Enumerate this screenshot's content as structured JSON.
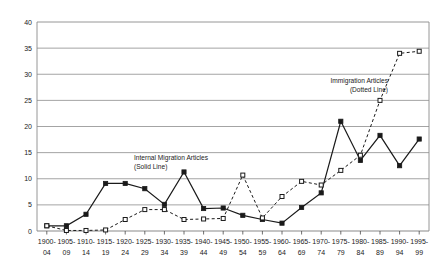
{
  "chart_data": {
    "type": "line",
    "title": "",
    "xlabel": "",
    "ylabel": "",
    "ylim": [
      0,
      40
    ],
    "ytick_step": 5,
    "grid": true,
    "legend_position": "inline-annotation",
    "yticks": [
      "0",
      "5",
      "10",
      "15",
      "20",
      "25",
      "30",
      "35",
      "40"
    ],
    "categories": [
      "1900-\n04",
      "1905-\n09",
      "1910-\n14",
      "1915-\n19",
      "1920-\n24",
      "1925-\n29",
      "1930-\n34",
      "1935-\n39",
      "1940-\n44",
      "1945-\n49",
      "1950-\n54",
      "1955-\n59",
      "1960-\n64",
      "1965-\n69",
      "1970-\n74",
      "1975-\n79",
      "1980-\n84",
      "1985-\n89",
      "1990-\n94",
      "1995-\n99"
    ],
    "categories_line1": [
      "1900-",
      "1905-",
      "1910-",
      "1915-",
      "1920-",
      "1925-",
      "1930-",
      "1935-",
      "1940-",
      "1945-",
      "1950-",
      "1955-",
      "1960-",
      "1965-",
      "1970-",
      "1975-",
      "1980-",
      "1985-",
      "1990-",
      "1995-"
    ],
    "categories_line2": [
      "04",
      "09",
      "14",
      "19",
      "24",
      "29",
      "34",
      "39",
      "44",
      "49",
      "54",
      "59",
      "64",
      "69",
      "74",
      "79",
      "84",
      "89",
      "94",
      "99"
    ],
    "series": [
      {
        "name": "Internal Migration Articles",
        "style": "solid",
        "marker": "filled-square",
        "color": "#1a1a1a",
        "annotation": "Internal Migration Articles\n(Solid Line)",
        "annotation_line1": "Internal Migration Articles",
        "annotation_line2": "(Solid Line)",
        "values": [
          1.0,
          1.0,
          3.2,
          9.1,
          9.1,
          8.1,
          5.1,
          11.3,
          4.3,
          4.4,
          3.0,
          2.2,
          1.5,
          4.5,
          7.3,
          21.0,
          13.5,
          18.3,
          12.5,
          17.6
        ]
      },
      {
        "name": "Immigration Articles",
        "style": "dotted",
        "marker": "open-square",
        "color": "#1a1a1a",
        "annotation": "Immigration Articles\n(Dotted Line)",
        "annotation_line1": "Immigration Articles",
        "annotation_line2": "(Dotted Line)",
        "values": [
          1.0,
          0.1,
          0.1,
          0.2,
          2.2,
          4.1,
          4.1,
          2.2,
          2.3,
          2.4,
          10.7,
          2.5,
          6.6,
          9.5,
          8.8,
          11.6,
          14.5,
          25.0,
          34.0,
          34.4
        ]
      }
    ]
  }
}
